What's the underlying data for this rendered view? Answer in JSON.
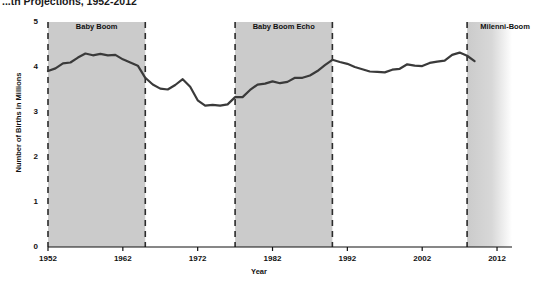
{
  "chart_data": {
    "type": "line",
    "title": "...th Projections, 1952-2012",
    "xlabel": "Year",
    "ylabel": "Number of Births in Millions",
    "xlim": [
      1952,
      2014
    ],
    "ylim": [
      0,
      5
    ],
    "yticks": [
      0,
      1,
      2,
      3,
      4,
      5
    ],
    "xticks": [
      1952,
      1962,
      1972,
      1982,
      1992,
      2002,
      2012
    ],
    "grid": false,
    "legend": "none",
    "line_color": "#3a3a3a",
    "band_color": "#cbcbcb",
    "series": [
      {
        "name": "Births",
        "x": [
          1952,
          1953,
          1954,
          1955,
          1956,
          1957,
          1958,
          1959,
          1960,
          1961,
          1962,
          1963,
          1964,
          1965,
          1966,
          1967,
          1968,
          1969,
          1970,
          1971,
          1972,
          1973,
          1974,
          1975,
          1976,
          1977,
          1978,
          1979,
          1980,
          1981,
          1982,
          1983,
          1984,
          1985,
          1986,
          1987,
          1988,
          1989,
          1990,
          1991,
          1992,
          1993,
          1994,
          1995,
          1996,
          1997,
          1998,
          1999,
          2000,
          2001,
          2002,
          2003,
          2004,
          2005,
          2006,
          2007,
          2008,
          2009
        ],
        "values": [
          3.91,
          3.97,
          4.08,
          4.1,
          4.21,
          4.3,
          4.26,
          4.29,
          4.26,
          4.27,
          4.17,
          4.1,
          4.03,
          3.76,
          3.61,
          3.52,
          3.5,
          3.6,
          3.73,
          3.56,
          3.26,
          3.14,
          3.16,
          3.14,
          3.17,
          3.33,
          3.33,
          3.49,
          3.61,
          3.63,
          3.68,
          3.64,
          3.67,
          3.76,
          3.76,
          3.81,
          3.91,
          4.04,
          4.16,
          4.11,
          4.07,
          4.0,
          3.95,
          3.9,
          3.89,
          3.88,
          3.94,
          3.96,
          4.06,
          4.03,
          4.02,
          4.09,
          4.12,
          4.14,
          4.27,
          4.32,
          4.25,
          4.13
        ]
      }
    ],
    "bands": [
      {
        "label": "Baby Boom",
        "start": 1952,
        "end": 1965,
        "fade": false
      },
      {
        "label": "Baby Boom Echo",
        "start": 1977,
        "end": 1990,
        "fade": false
      },
      {
        "label": "Milenni-Boom",
        "start": 2008,
        "end": 2014,
        "fade": true
      }
    ]
  }
}
